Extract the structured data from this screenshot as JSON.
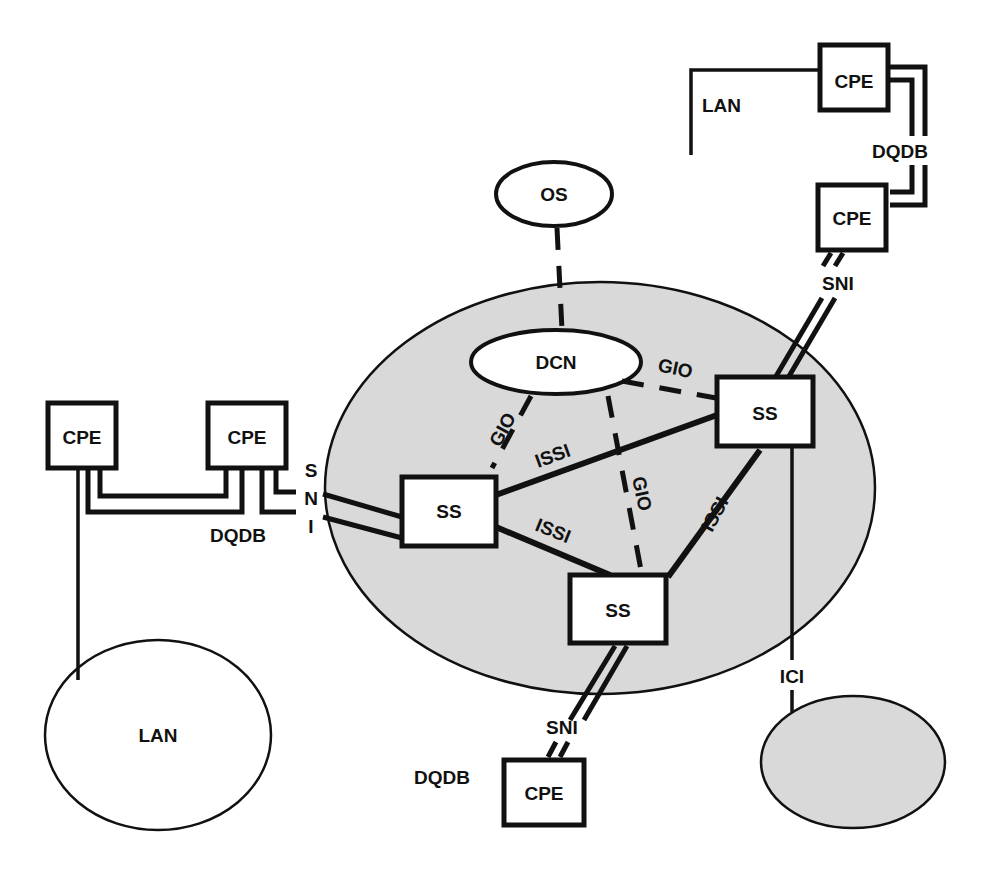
{
  "diagram": {
    "colors": {
      "cloud_fill": "#d9d9d9",
      "stroke": "#111111",
      "box_fill": "#ffffff"
    },
    "nodes": {
      "os": {
        "label": "OS"
      },
      "dcn": {
        "label": "DCN"
      },
      "ss_left": {
        "label": "SS"
      },
      "ss_right": {
        "label": "SS"
      },
      "ss_bottom": {
        "label": "SS"
      },
      "cpe_top1": {
        "label": "CPE"
      },
      "cpe_top2": {
        "label": "CPE"
      },
      "cpe_left1": {
        "label": "CPE"
      },
      "cpe_left2": {
        "label": "CPE"
      },
      "cpe_bottom": {
        "label": "CPE"
      },
      "lan_oval": {
        "label": "LAN"
      },
      "other_network": {
        "label": ""
      }
    },
    "labels": {
      "lan_top": "LAN",
      "dqdb_top": "DQDB",
      "sni_top": "SNI",
      "sni_left_s": "S",
      "sni_left_n": "N",
      "sni_left_i": "I",
      "dqdb_left": "DQDB",
      "gio_left": "GIO",
      "gio_mid": "GIO",
      "gio_right": "GIO",
      "issi_top": "ISSI",
      "issi_bottom": "ISSI",
      "issi_right": "ISSI",
      "sni_bottom": "SNI",
      "dqdb_bottom": "DQDB",
      "ici": "ICI"
    }
  }
}
